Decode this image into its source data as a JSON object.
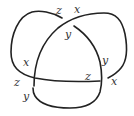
{
  "diagram": {
    "type": "knot-diagram",
    "stroke_color": "#222222",
    "label_color": "#333333",
    "labels": [
      {
        "id": "top-z",
        "text": "z",
        "x": 56,
        "y": 14
      },
      {
        "id": "top-x",
        "text": "x",
        "x": 74,
        "y": 13
      },
      {
        "id": "inner-top-y",
        "text": "y",
        "x": 65,
        "y": 38
      },
      {
        "id": "left-x",
        "text": "x",
        "x": 23,
        "y": 66
      },
      {
        "id": "right-y",
        "text": "y",
        "x": 102,
        "y": 64
      },
      {
        "id": "left-z",
        "text": "z",
        "x": 14,
        "y": 86
      },
      {
        "id": "inner-bottom-z",
        "text": "z",
        "x": 85,
        "y": 80
      },
      {
        "id": "right-x",
        "text": "x",
        "x": 111,
        "y": 85
      },
      {
        "id": "left-y",
        "text": "y",
        "x": 23,
        "y": 100
      }
    ]
  }
}
